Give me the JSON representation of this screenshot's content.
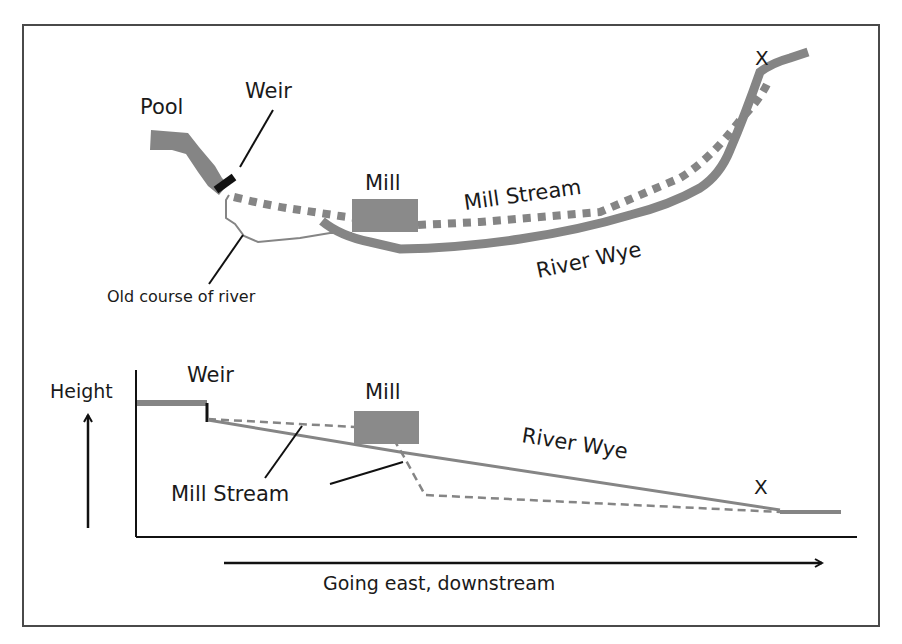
{
  "colors": {
    "frame": "#4a4a4a",
    "river": "#858585",
    "mill": "#8a8a8a",
    "weir": "#111111",
    "text": "#1a1a1a",
    "leader": "#111111"
  },
  "map_view": {
    "labels": {
      "pool": "Pool",
      "weir": "Weir",
      "mill": "Mill",
      "mill_stream": "Mill Stream",
      "river_wye": "River Wye",
      "old_course": "Old course of river",
      "x_marker": "X"
    }
  },
  "profile_view": {
    "labels": {
      "height": "Height",
      "weir": "Weir",
      "mill": "Mill",
      "river_wye": "River Wye",
      "mill_stream": "Mill Stream",
      "x_marker": "X",
      "direction": "Going east, downstream"
    }
  }
}
